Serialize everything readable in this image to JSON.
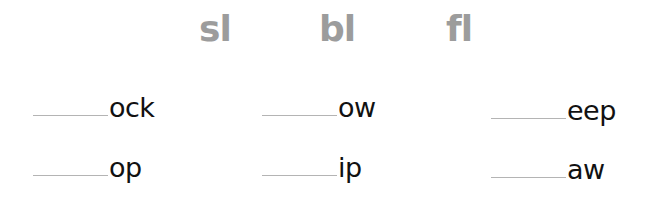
{
  "worksheet": {
    "blends": [
      "sl",
      "bl",
      "fl"
    ],
    "rows": [
      {
        "items": [
          {
            "blank": "",
            "ending": "ock"
          },
          {
            "blank": "",
            "ending": "ow"
          },
          {
            "blank": "",
            "ending": "eep"
          }
        ]
      },
      {
        "items": [
          {
            "blank": "",
            "ending": "op"
          },
          {
            "blank": "",
            "ending": "ip"
          },
          {
            "blank": "",
            "ending": "aw"
          }
        ]
      }
    ]
  },
  "colors": {
    "blend_text": "#9c9c9c",
    "ending_text": "#111111",
    "blank_line": "#b4b4b4"
  }
}
